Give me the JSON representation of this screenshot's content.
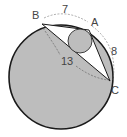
{
  "diagram": {
    "type": "geometry",
    "points": {
      "A": {
        "label": "A",
        "x": 89,
        "y": 30
      },
      "B": {
        "label": "B",
        "x": 42,
        "y": 24
      },
      "C": {
        "label": "C",
        "x": 110,
        "y": 81
      }
    },
    "sides": {
      "AB": {
        "label": "7"
      },
      "AC": {
        "label": "8"
      },
      "BC": {
        "label": "13"
      }
    },
    "circumcircle": {
      "cx": 61,
      "cy": 77,
      "r": 52
    },
    "incircle": {
      "cx": 80,
      "cy": 41,
      "r": 12
    },
    "colors": {
      "shade": "#bdbdbd",
      "stroke": "#1a1a1a",
      "dash": "#777777",
      "background": "#ffffff"
    }
  }
}
